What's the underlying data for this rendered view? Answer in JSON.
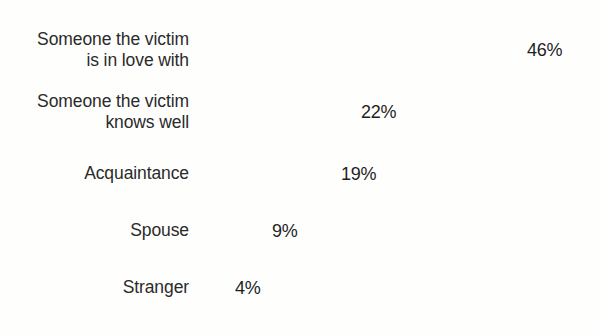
{
  "chart_data": {
    "type": "bar",
    "orientation": "horizontal",
    "title": "",
    "subtitle": "",
    "xlabel": "",
    "ylabel": "",
    "grid": false,
    "legend": "none",
    "xlim": [
      0,
      46
    ],
    "value_suffix": "%",
    "categories": [
      "Someone the victim\nis in love with",
      "Someone the victim\nknows well",
      "Acquaintance",
      "Spouse",
      "Stranger"
    ],
    "values": [
      46,
      22,
      19,
      9,
      4
    ],
    "value_labels": [
      "46%",
      "22%",
      "19%",
      "9%",
      "4%"
    ],
    "bar_colors": [
      "#242424",
      "#3b3b3b",
      "#5c5c5c",
      "#909090",
      "#cacaca"
    ],
    "background_color": "#fefefd",
    "text_color": "#2b2b2b"
  }
}
